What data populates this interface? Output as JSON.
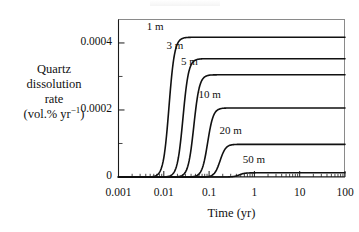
{
  "chart_data": {
    "type": "line",
    "title": "",
    "xlabel": "Time (yr)",
    "ylabel_lines": [
      "Quartz",
      "dissolution",
      "rate",
      "(vol.% yr",
      ")"
    ],
    "ylabel_text": "Quartz dissolution rate (vol.% yr-1)",
    "ylabel_exponent": "−1",
    "xscale": "log",
    "yscale": "linear",
    "xlim": [
      0.001,
      100
    ],
    "ylim": [
      0,
      0.00047
    ],
    "grid": false,
    "legend": "inline-curve-labels",
    "xticks": [
      0.001,
      0.01,
      0.1,
      1,
      10,
      100
    ],
    "xtick_labels": [
      "0.001",
      "0.01",
      "0.1",
      "1",
      "10",
      "100"
    ],
    "yticks": [
      0,
      0.0001,
      0.0002,
      0.0003,
      0.0004
    ],
    "ytick_labels": [
      "0",
      "",
      "0.0002",
      "",
      "0.0004"
    ],
    "ytick_labels_shown": [
      "0",
      "0.0002",
      "0.0004"
    ],
    "series": [
      {
        "name": "1 m",
        "label": "1 m",
        "plateau": 0.000417,
        "midpoint_yr": 0.013,
        "label_x": 0.0042,
        "label_y": 0.000447
      },
      {
        "name": "3 m",
        "label": "3 m",
        "plateau": 0.000353,
        "midpoint_yr": 0.0265,
        "label_x": 0.0115,
        "label_y": 0.000392
      },
      {
        "name": "5 m",
        "label": "5 m",
        "plateau": 0.000305,
        "midpoint_yr": 0.046,
        "label_x": 0.024,
        "label_y": 0.000344
      },
      {
        "name": "10 m",
        "label": "10 m",
        "plateau": 0.000206,
        "midpoint_yr": 0.093,
        "label_x": 0.058,
        "label_y": 0.000244
      },
      {
        "name": "20 m",
        "label": "20 m",
        "plateau": 9.75e-05,
        "midpoint_yr": 0.175,
        "label_x": 0.17,
        "label_y": 0.000136
      },
      {
        "name": "50 m",
        "label": "50 m",
        "plateau": 1.25e-05,
        "midpoint_yr": 0.46,
        "label_x": 0.55,
        "label_y": 4.95e-05
      }
    ]
  }
}
